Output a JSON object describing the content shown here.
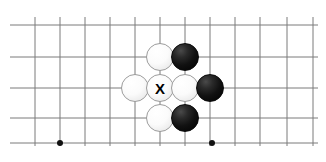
{
  "figure": {
    "name": "go-board-diagram",
    "width": 326,
    "height": 162,
    "background_color": "#ffffff"
  },
  "board": {
    "line_color": "#7a7a7a",
    "line_width": 1,
    "cell_size": 25,
    "vertical_lines_x": [
      35,
      60,
      85,
      110,
      135,
      160,
      185,
      210,
      235,
      260,
      287,
      313
    ],
    "horizontal_lines_y": [
      25,
      57,
      88,
      118,
      143
    ],
    "horizontal_extent_x": [
      10,
      318
    ],
    "vertical_extent_y": [
      17,
      146
    ],
    "star_points": [
      {
        "name": "star-point-left",
        "x": 60,
        "y": 143
      },
      {
        "name": "star-point-right",
        "x": 212,
        "y": 143
      }
    ],
    "star_point_radius": 3,
    "star_point_color": "#111111"
  },
  "stones": [
    {
      "name": "white-stone-top",
      "color": "white",
      "x": 160,
      "y": 57,
      "radius": 14,
      "mark": ""
    },
    {
      "name": "black-stone-top-right",
      "color": "black",
      "x": 185,
      "y": 57,
      "radius": 14,
      "mark": ""
    },
    {
      "name": "white-stone-left",
      "color": "white",
      "x": 135,
      "y": 88,
      "radius": 14,
      "mark": ""
    },
    {
      "name": "white-stone-center-marked",
      "color": "white",
      "x": 160,
      "y": 88,
      "radius": 14,
      "mark": "X"
    },
    {
      "name": "white-stone-right",
      "color": "white",
      "x": 185,
      "y": 88,
      "radius": 14,
      "mark": ""
    },
    {
      "name": "black-stone-right",
      "color": "black",
      "x": 210,
      "y": 88,
      "radius": 14,
      "mark": ""
    },
    {
      "name": "white-stone-bottom",
      "color": "white",
      "x": 160,
      "y": 118,
      "radius": 14,
      "mark": ""
    },
    {
      "name": "black-stone-bottom-right",
      "color": "black",
      "x": 185,
      "y": 118,
      "radius": 14,
      "mark": ""
    }
  ],
  "colors": {
    "white_stone": "#ffffff",
    "black_stone": "#000000",
    "grid_line": "#7a7a7a",
    "mark_text": "#000000"
  }
}
